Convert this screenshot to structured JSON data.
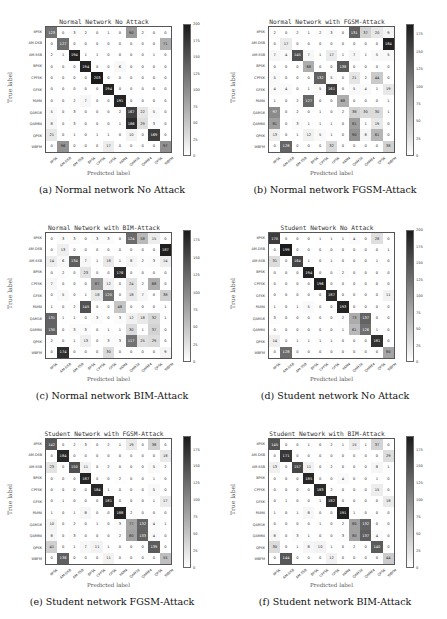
{
  "figure": {
    "classes": [
      "8PSK",
      "AM-DSB",
      "AM-SSB",
      "BPSK",
      "CPFSK",
      "GFSK",
      "PAM4",
      "QAM16",
      "QAM64",
      "QPSK",
      "WBFM"
    ],
    "xlabel": "Predicted label",
    "ylabel": "True label"
  },
  "chart_data": [
    {
      "type": "heatmap",
      "id": "a",
      "title": "Normal Network No Attack",
      "caption": "(a) Normal network No Attack",
      "xlabel": "Predicted label",
      "ylabel": "True label",
      "vmax": 200,
      "colorbar_ticks": [
        0,
        25,
        50,
        75,
        100,
        125,
        150,
        175,
        200
      ],
      "categories": [
        "8PSK",
        "AM-DSB",
        "AM-SSB",
        "BPSK",
        "CPFSK",
        "GFSK",
        "PAM4",
        "QAM16",
        "QAM64",
        "QPSK",
        "WBFM"
      ],
      "matrix": [
        [
          123,
          0,
          3,
          2,
          0,
          1,
          0,
          90,
          2,
          0,
          0
        ],
        [
          0,
          127,
          0,
          0,
          0,
          0,
          0,
          0,
          0,
          0,
          71
        ],
        [
          2,
          1,
          194,
          1,
          1,
          0,
          0,
          0,
          0,
          1,
          0
        ],
        [
          0,
          0,
          0,
          194,
          0,
          0,
          6,
          0,
          0,
          0,
          0
        ],
        [
          0,
          0,
          0,
          0,
          203,
          0,
          0,
          0,
          0,
          0,
          0
        ],
        [
          0,
          0,
          0,
          0,
          0,
          194,
          0,
          0,
          0,
          0,
          0
        ],
        [
          0,
          0,
          2,
          7,
          0,
          0,
          191,
          0,
          0,
          0,
          0
        ],
        [
          5,
          0,
          3,
          0,
          0,
          0,
          2,
          167,
          22,
          5,
          0
        ],
        [
          8,
          0,
          3,
          0,
          0,
          0,
          1,
          186,
          29,
          3,
          0
        ],
        [
          21,
          0,
          1,
          0,
          1,
          1,
          0,
          10,
          0,
          169,
          0
        ],
        [
          0,
          96,
          0,
          0,
          0,
          17,
          0,
          0,
          0,
          0,
          97
        ]
      ]
    },
    {
      "type": "heatmap",
      "id": "b",
      "title": "Normal Network with FGSM-Attack",
      "caption": "(b) Normal network FGSM-Attack",
      "xlabel": "Predicted label",
      "ylabel": "True label",
      "vmax": 190,
      "colorbar_ticks": [
        0,
        25,
        50,
        75,
        100,
        125,
        150,
        175
      ],
      "categories": [
        "8PSK",
        "AM-DSB",
        "AM-SSB",
        "BPSK",
        "CPFSK",
        "GFSK",
        "PAM4",
        "QAM16",
        "QAM64",
        "QPSK",
        "WBFM"
      ],
      "matrix": [
        [
          2,
          0,
          2,
          1,
          2,
          3,
          0,
          131,
          37,
          20,
          9
        ],
        [
          0,
          17,
          0,
          0,
          0,
          0,
          0,
          0,
          0,
          0,
          184
        ],
        [
          7,
          4,
          145,
          7,
          1,
          17,
          1,
          7,
          1,
          5,
          5
        ],
        [
          0,
          0,
          0,
          68,
          0,
          0,
          138,
          0,
          0,
          0,
          0
        ],
        [
          5,
          0,
          0,
          0,
          132,
          5,
          0,
          21,
          2,
          44,
          0
        ],
        [
          4,
          4,
          0,
          1,
          5,
          161,
          0,
          5,
          4,
          1,
          19
        ],
        [
          1,
          0,
          2,
          127,
          0,
          0,
          68,
          0,
          0,
          0,
          1
        ],
        [
          97,
          0,
          2,
          0,
          1,
          0,
          2,
          38,
          30,
          30,
          1
        ],
        [
          81,
          0,
          3,
          1,
          1,
          1,
          0,
          81,
          1,
          19,
          0
        ],
        [
          13,
          0,
          1,
          12,
          5,
          1,
          0,
          90,
          8,
          61,
          0
        ],
        [
          0,
          128,
          0,
          0,
          0,
          32,
          0,
          0,
          0,
          0,
          38
        ]
      ]
    },
    {
      "type": "heatmap",
      "id": "c",
      "title": "Normal Network with BIM-Attack",
      "caption": "(c) Normal network BIM-Attack",
      "xlabel": "Predicted label",
      "ylabel": "True label",
      "vmax": 190,
      "colorbar_ticks": [
        0,
        25,
        50,
        75,
        100,
        125,
        150,
        175
      ],
      "categories": [
        "8PSK",
        "AM-DSB",
        "AM-SSB",
        "BPSK",
        "CPFSK",
        "GFSK",
        "PAM4",
        "QAM16",
        "QAM64",
        "QPSK",
        "WBFM"
      ],
      "matrix": [
        [
          0,
          3,
          3,
          0,
          3,
          3,
          0,
          124,
          58,
          15,
          0
        ],
        [
          0,
          13,
          0,
          0,
          0,
          0,
          0,
          0,
          0,
          0,
          187
        ],
        [
          14,
          6,
          134,
          7,
          1,
          18,
          1,
          8,
          2,
          3,
          14
        ],
        [
          0,
          2,
          0,
          23,
          0,
          0,
          176,
          0,
          0,
          0,
          0
        ],
        [
          7,
          0,
          0,
          0,
          87,
          12,
          0,
          24,
          2,
          68,
          0
        ],
        [
          0,
          5,
          0,
          1,
          18,
          120,
          0,
          18,
          7,
          0,
          38
        ],
        [
          1,
          0,
          2,
          145,
          0,
          0,
          48,
          0,
          0,
          0,
          1
        ],
        [
          131,
          1,
          1,
          0,
          3,
          0,
          3,
          12,
          18,
          32,
          1
        ],
        [
          130,
          0,
          3,
          3,
          0,
          1,
          1,
          30,
          1,
          37,
          0
        ],
        [
          2,
          0,
          1,
          13,
          0,
          3,
          3,
          117,
          25,
          29,
          0
        ],
        [
          0,
          174,
          0,
          0,
          0,
          30,
          0,
          0,
          0,
          0,
          9
        ]
      ]
    },
    {
      "type": "heatmap",
      "id": "d",
      "title": "Student Network No Attack",
      "caption": "(d) Student network No Attack",
      "xlabel": "Predicted label",
      "ylabel": "True label",
      "vmax": 200,
      "colorbar_ticks": [
        0,
        25,
        50,
        75,
        100,
        125,
        150,
        175,
        200
      ],
      "categories": [
        "8PSK",
        "AM-DSB",
        "AM-SSB",
        "BPSK",
        "CPFSK",
        "GFSK",
        "PAM4",
        "QAM16",
        "QAM64",
        "QPSK",
        "WBFM"
      ],
      "matrix": [
        [
          170,
          0,
          0,
          0,
          1,
          1,
          1,
          4,
          0,
          28,
          0
        ],
        [
          0,
          199,
          0,
          0,
          0,
          0,
          0,
          0,
          0,
          0,
          1
        ],
        [
          31,
          0,
          164,
          1,
          0,
          1,
          0,
          0,
          0,
          1,
          0
        ],
        [
          0,
          0,
          0,
          194,
          0,
          0,
          2,
          0,
          0,
          0,
          0
        ],
        [
          0,
          0,
          0,
          0,
          196,
          0,
          0,
          0,
          0,
          0,
          0
        ],
        [
          0,
          0,
          0,
          0,
          0,
          187,
          0,
          0,
          0,
          0,
          11
        ],
        [
          1,
          0,
          1,
          5,
          0,
          0,
          193,
          0,
          0,
          0,
          0
        ],
        [
          3,
          0,
          0,
          0,
          0,
          0,
          2,
          73,
          137,
          0,
          0
        ],
        [
          0,
          0,
          0,
          0,
          0,
          0,
          1,
          61,
          126,
          1,
          0
        ],
        [
          14,
          0,
          1,
          1,
          1,
          1,
          0,
          0,
          0,
          181,
          0
        ],
        [
          0,
          128,
          0,
          0,
          0,
          0,
          0,
          0,
          0,
          0,
          80
        ]
      ]
    },
    {
      "type": "heatmap",
      "id": "e",
      "title": "Student Network with FGSM-Attack",
      "caption": "(e) Student network FGSM-Attack",
      "xlabel": "Predicted label",
      "ylabel": "True label",
      "vmax": 195,
      "colorbar_ticks": [
        0,
        25,
        50,
        75,
        100,
        125,
        150,
        175
      ],
      "categories": [
        "8PSK",
        "AM-DSB",
        "AM-SSB",
        "BPSK",
        "CPFSK",
        "GFSK",
        "PAM4",
        "QAM16",
        "QAM64",
        "QPSK",
        "WBFM"
      ],
      "matrix": [
        [
          142,
          0,
          2,
          3,
          0,
          2,
          1,
          19,
          0,
          38,
          0
        ],
        [
          0,
          184,
          0,
          0,
          0,
          0,
          0,
          0,
          0,
          0,
          18
        ],
        [
          23,
          0,
          150,
          11,
          0,
          2,
          0,
          0,
          0,
          5,
          2
        ],
        [
          0,
          0,
          0,
          187,
          0,
          0,
          2,
          0,
          0,
          1,
          0
        ],
        [
          0,
          0,
          0,
          0,
          184,
          1,
          0,
          0,
          0,
          5,
          0
        ],
        [
          0,
          1,
          0,
          0,
          0,
          181,
          0,
          0,
          0,
          1,
          17
        ],
        [
          1,
          0,
          1,
          8,
          0,
          0,
          188,
          2,
          0,
          0,
          0
        ],
        [
          10,
          0,
          2,
          0,
          1,
          0,
          3,
          77,
          132,
          4,
          1
        ],
        [
          8,
          0,
          3,
          0,
          0,
          0,
          2,
          80,
          133,
          4,
          0
        ],
        [
          41,
          0,
          1,
          7,
          11,
          1,
          0,
          0,
          0,
          139,
          0
        ],
        [
          0,
          136,
          0,
          0,
          0,
          11,
          0,
          0,
          0,
          0,
          55
        ]
      ]
    },
    {
      "type": "heatmap",
      "id": "f",
      "title": "Student Network with BIM-Attack",
      "caption": "(f) Student network BIM-Attack",
      "xlabel": "Predicted label",
      "ylabel": "True label",
      "vmax": 195,
      "colorbar_ticks": [
        0,
        25,
        50,
        75,
        100,
        125,
        150,
        175
      ],
      "categories": [
        "8PSK",
        "AM-DSB",
        "AM-SSB",
        "BPSK",
        "CPFSK",
        "GFSK",
        "PAM4",
        "QAM16",
        "QAM64",
        "QPSK",
        "WBFM"
      ],
      "matrix": [
        [
          145,
          0,
          0,
          1,
          0,
          2,
          1,
          15,
          1,
          37,
          0
        ],
        [
          0,
          171,
          0,
          0,
          0,
          0,
          0,
          0,
          0,
          0,
          29
        ],
        [
          13,
          0,
          157,
          11,
          0,
          2,
          0,
          0,
          0,
          8,
          1
        ],
        [
          0,
          0,
          0,
          185,
          0,
          0,
          4,
          0,
          0,
          1,
          0
        ],
        [
          0,
          0,
          0,
          0,
          183,
          2,
          0,
          0,
          0,
          15,
          0
        ],
        [
          0,
          1,
          0,
          0,
          1,
          182,
          0,
          0,
          0,
          0,
          18
        ],
        [
          1,
          0,
          1,
          8,
          0,
          0,
          191,
          1,
          0,
          0,
          0
        ],
        [
          0,
          0,
          0,
          0,
          1,
          0,
          2,
          80,
          132,
          0,
          0
        ],
        [
          8,
          0,
          3,
          1,
          0,
          0,
          3,
          80,
          137,
          4,
          0
        ],
        [
          30,
          0,
          1,
          8,
          10,
          1,
          0,
          2,
          0,
          140,
          0
        ],
        [
          0,
          144,
          0,
          0,
          0,
          12,
          0,
          0,
          0,
          0,
          44
        ]
      ]
    }
  ]
}
